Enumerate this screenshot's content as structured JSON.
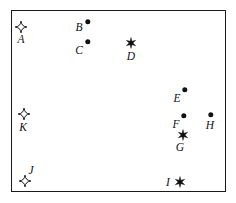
{
  "figure": {
    "title": "",
    "frame": {
      "x": 11,
      "y": 10,
      "width": 215,
      "height": 182,
      "border_color": "#1a1a1a",
      "background": "#ffffff"
    },
    "marker_color": "#111111",
    "label_color": "#111111"
  },
  "chart_data": {
    "type": "scatter",
    "title": "",
    "xlabel": "",
    "ylabel": "",
    "grid": false,
    "legend": "none",
    "xlim": [
      0,
      236
    ],
    "ylim": [
      0,
      203
    ],
    "marker_kinds": [
      "dot",
      "sparkle",
      "asterisk"
    ],
    "points": [
      {
        "label": "A",
        "marker": "sparkle",
        "x": 21,
        "y": 27,
        "label_x": 21,
        "label_y": 39
      },
      {
        "label": "B",
        "marker": "dot",
        "x": 88,
        "y": 22,
        "label_x": 79,
        "label_y": 27
      },
      {
        "label": "C",
        "marker": "dot",
        "x": 88,
        "y": 42,
        "label_x": 79,
        "label_y": 50
      },
      {
        "label": "D",
        "marker": "asterisk",
        "x": 131,
        "y": 43,
        "label_x": 131,
        "label_y": 56
      },
      {
        "label": "E",
        "marker": "dot",
        "x": 185,
        "y": 90,
        "label_x": 177,
        "label_y": 98
      },
      {
        "label": "F",
        "marker": "dot",
        "x": 184,
        "y": 116,
        "label_x": 176,
        "label_y": 124
      },
      {
        "label": "G",
        "marker": "asterisk",
        "x": 183,
        "y": 135,
        "label_x": 180,
        "label_y": 147
      },
      {
        "label": "H",
        "marker": "dot",
        "x": 211,
        "y": 115,
        "label_x": 210,
        "label_y": 125
      },
      {
        "label": "I",
        "marker": "asterisk",
        "x": 180,
        "y": 182,
        "label_x": 168,
        "label_y": 182
      },
      {
        "label": "J",
        "marker": "sparkle",
        "x": 25,
        "y": 181,
        "label_x": 31,
        "label_y": 170
      },
      {
        "label": "K",
        "marker": "sparkle",
        "x": 24,
        "y": 114,
        "label_x": 23,
        "label_y": 127
      }
    ]
  }
}
